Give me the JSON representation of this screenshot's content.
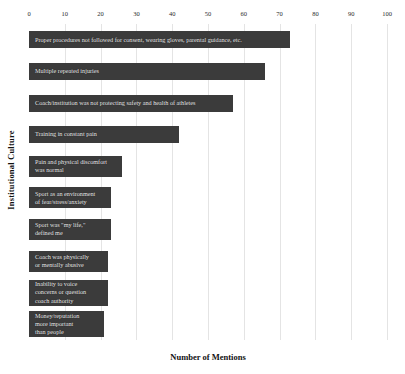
{
  "chart_data": {
    "type": "bar",
    "orientation": "horizontal",
    "title": "",
    "xlabel": "Number of Mentions",
    "ylabel": "Institutional Culture",
    "xlim": [
      0,
      100
    ],
    "xticks": [
      0,
      10,
      20,
      30,
      40,
      50,
      60,
      70,
      80,
      90,
      100
    ],
    "grid": true,
    "legend": false,
    "bar_color": "#3b3b3b",
    "label_color": "#e9e9e9",
    "background": "#ffffff",
    "categories": [
      "Proper procedures not followed for consent, wearing gloves, parental guidance, etc.",
      "Multiple repeated injuries",
      "Coach/institution was not protecting safety and health of athletes",
      "Training in constant pain",
      "Pain and physical discomfort\nwas normal",
      "Sport as an environment\nof fear/stress/anxiety",
      "Sport was \"my life,\"\ndefined me",
      "Coach was physically\nor mentally abusive",
      "Inability to voice\nconcerns or question\ncoach authority",
      "Money/reputation\nmore important\nthan people"
    ],
    "values": [
      73,
      66,
      57,
      42,
      26,
      23,
      23,
      22,
      22,
      21
    ]
  }
}
